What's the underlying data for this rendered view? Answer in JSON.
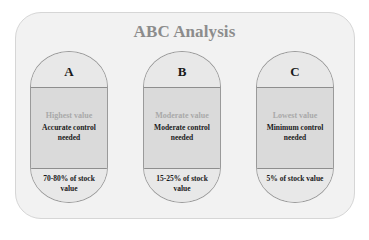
{
  "diagram": {
    "title": "ABC Analysis",
    "categories": [
      {
        "letter": "A",
        "value_label": "Highest value",
        "control_label": "Accurate control needed",
        "share_label": "70-80% of stock value"
      },
      {
        "letter": "B",
        "value_label": "Moderate value",
        "control_label": "Moderate control needed",
        "share_label": "15-25% of stock value"
      },
      {
        "letter": "C",
        "value_label": "Lowest value",
        "control_label": "Minimum control needed",
        "share_label": "5% of stock value"
      }
    ],
    "colors": {
      "panel_bg": "#f2f2f2",
      "title": "#8c8c8c",
      "capsule_light": "#e8e8e8",
      "capsule_mid": "#dadada",
      "value_label": "#a9a9a9",
      "text_dark": "#1a1a1a"
    }
  }
}
